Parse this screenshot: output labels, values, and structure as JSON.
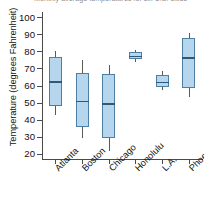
{
  "chart_data": {
    "type": "box",
    "title": "Monthly average temperatures for six U.S. cities",
    "xlabel": "",
    "ylabel": "Temperature (degrees Fahrenheit)",
    "ylim": [
      17,
      103
    ],
    "yticks": [
      20,
      30,
      40,
      50,
      60,
      70,
      80,
      90,
      100
    ],
    "grid": false,
    "legend": "none",
    "categories": [
      "Atlanta",
      "Boston",
      "Chicago",
      "Honolulu",
      "L.A.",
      "Phoenix"
    ],
    "boxes": [
      {
        "label": "Atlanta",
        "min": 43.0,
        "q1": 48.0,
        "median": 62.5,
        "q3": 76.5,
        "max": 80.0
      },
      {
        "label": "Boston",
        "min": 29.0,
        "q1": 36.0,
        "median": 51.0,
        "q3": 67.5,
        "max": 75.0
      },
      {
        "label": "Chicago",
        "min": 21.5,
        "q1": 29.0,
        "median": 49.5,
        "q3": 67.0,
        "max": 72.0
      },
      {
        "label": "Honolulu",
        "min": 74.0,
        "q1": 75.5,
        "median": 77.5,
        "q3": 79.5,
        "max": 80.5
      },
      {
        "label": "L.A.",
        "min": 57.5,
        "q1": 59.0,
        "median": 62.0,
        "q3": 66.0,
        "max": 68.5
      },
      {
        "label": "Phoenix",
        "min": 53.5,
        "q1": 58.5,
        "median": 76.5,
        "q3": 88.0,
        "max": 91.0
      }
    ],
    "colors": {
      "box_fill": "#b5d6ec",
      "box_edge": "#4c7fa3",
      "median": "#2d5a7a",
      "whisker": "#5a5a52",
      "axis": "#4a4a4a"
    }
  }
}
